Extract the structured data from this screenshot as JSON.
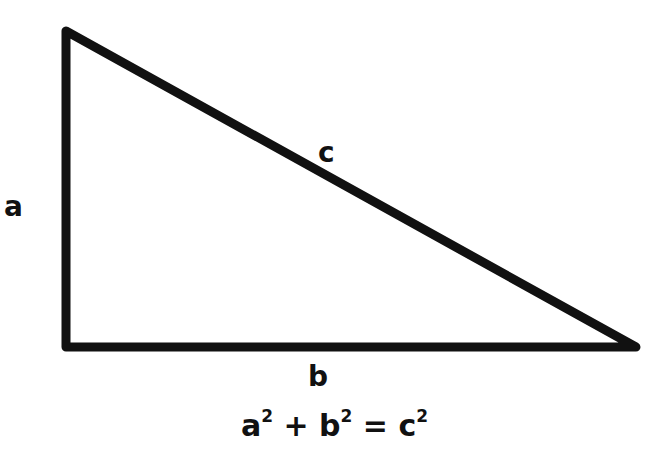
{
  "diagram": {
    "labels": {
      "a": "a",
      "b": "b",
      "c": "c"
    },
    "equation": {
      "parts": [
        "a",
        "2",
        " + ",
        "b",
        "2",
        " = ",
        "c",
        "2"
      ]
    },
    "stroke_color": "#111111",
    "background": "#ffffff"
  }
}
